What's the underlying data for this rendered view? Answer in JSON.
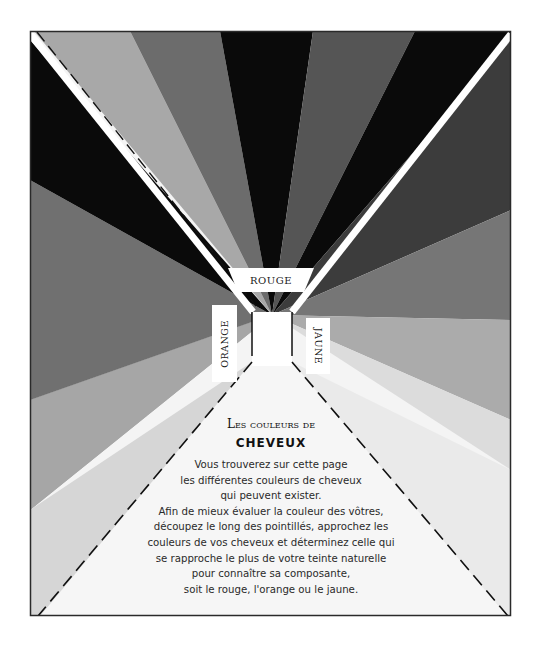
{
  "labels": {
    "top": "ROUGE",
    "left": "ORANGE",
    "right": "JAUNE"
  },
  "title": {
    "small": "Les couleurs de",
    "big": "cheveux"
  },
  "body": {
    "lines": [
      "Vous trouverez sur cette page",
      "les différentes couleurs de cheveux",
      "qui peuvent exister.",
      "Afin de mieux évaluer la couleur des vôtres,",
      "découpez le long des pointillés, approchez les",
      "couleurs de vos cheveux et déterminez celle qui",
      "se rapproche le plus de votre teinte naturelle",
      "pour connaître sa composante,",
      "soit le rouge, l'orange ou le jaune."
    ]
  },
  "colors": {
    "black": "#0a0a0a",
    "dark_gray": "#3c3c3c",
    "mid_gray": "#6e6e6e",
    "light_gray": "#a8a8a8",
    "pale_gray": "#d4d4d4",
    "very_light": "#f4f4f4",
    "frame_border": "#2a2a2a"
  }
}
